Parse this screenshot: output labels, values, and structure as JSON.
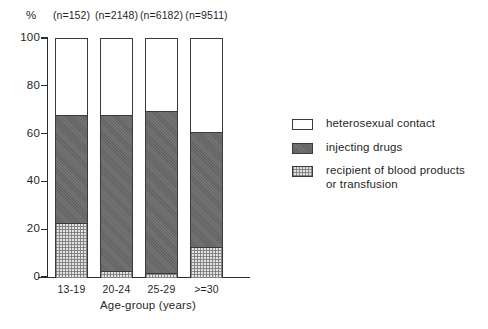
{
  "chart_data": {
    "type": "bar",
    "subtype": "stacked-vertical-100",
    "title": "",
    "xlabel": "Age-group (years)",
    "ylabel": "%",
    "ylim": [
      0,
      100
    ],
    "yticks": [
      0,
      20,
      40,
      60,
      80,
      100
    ],
    "ytick_labels": [
      "0",
      "20",
      "40",
      "60",
      "80",
      "100"
    ],
    "grid": false,
    "legend_position": "right",
    "categories": [
      "13-19",
      "20-24",
      "25-29",
      ">=30"
    ],
    "group_counts": [
      "(n=152)",
      "(n=2148)",
      "(n=6182)",
      "(n=9511)"
    ],
    "group_n_values": [
      152,
      2148,
      6182,
      9511
    ],
    "series": [
      {
        "name": "heterosexual contact",
        "fill": "white",
        "values": [
          32,
          32,
          30,
          39
        ]
      },
      {
        "name": "injecting drugs",
        "fill": "solid-gray",
        "values": [
          45,
          65,
          68,
          48
        ]
      },
      {
        "name": "recipient of blood products or transfusion",
        "fill": "hatched-light",
        "values": [
          23,
          3,
          2,
          13
        ]
      }
    ],
    "stack_order_bottom_to_top": [
      "recipient of blood products or transfusion",
      "injecting drugs",
      "heterosexual contact"
    ],
    "cumulative_tops": {
      "recipient of blood products or transfusion": [
        23,
        3,
        2,
        13
      ],
      "injecting drugs": [
        68,
        68,
        70,
        61
      ],
      "heterosexual contact": [
        100,
        100,
        100,
        100
      ]
    }
  },
  "axis": {
    "y_unit_symbol": "%",
    "x_title": "Age-group (years)",
    "y_ticks": [
      "100",
      "80",
      "60",
      "40",
      "20",
      "0"
    ]
  },
  "legend": {
    "items": [
      {
        "label": "heterosexual contact",
        "swatch": "white-swatch"
      },
      {
        "label": "injecting drugs",
        "swatch": "dark-gray-swatch"
      },
      {
        "label": "recipient of blood products or transfusion",
        "swatch": "light-hatched-swatch"
      }
    ]
  },
  "colors": {
    "axis": "#2b2b2b",
    "text": "#1f1f1f",
    "heterosexual_contact": "#ffffff",
    "injecting_drugs": "#6e6e6e",
    "recipient_blood_products": "#e3e3e3",
    "background": "#ffffff"
  }
}
